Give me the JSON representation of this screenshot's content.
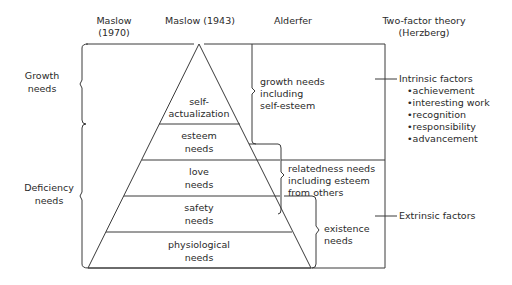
{
  "headers": {
    "maslow_1970": [
      "Maslow",
      "(1970)"
    ],
    "maslow_1943": "Maslow (1943)",
    "alderfer": "Alderfer",
    "herzberg": [
      "Two-factor theory",
      "(Herzberg)"
    ]
  },
  "maslow_1970_groups": [
    {
      "lines": [
        "Growth",
        "needs"
      ]
    },
    {
      "lines": [
        "Deficiency",
        "needs"
      ]
    }
  ],
  "pyramid_levels": [
    {
      "lines": [
        "self-",
        "actualization"
      ]
    },
    {
      "lines": [
        "esteem",
        "needs"
      ]
    },
    {
      "lines": [
        "love",
        "needs"
      ]
    },
    {
      "lines": [
        "safety",
        "needs"
      ]
    },
    {
      "lines": [
        "physiological",
        "needs"
      ]
    }
  ],
  "alderfer_groups": [
    {
      "lines": [
        "growth needs",
        "including",
        "self-esteem"
      ]
    },
    {
      "lines": [
        "relatedness needs",
        "including esteem",
        "from others"
      ]
    },
    {
      "lines": [
        "existence",
        "needs"
      ]
    }
  ],
  "herzberg_groups": [
    {
      "title": "Intrinsic factors",
      "items": [
        "•achievement",
        "•interesting work",
        "•recognition",
        "•responsibility",
        "•advancement"
      ]
    },
    {
      "title": "Extrinsic factors",
      "items": []
    }
  ]
}
